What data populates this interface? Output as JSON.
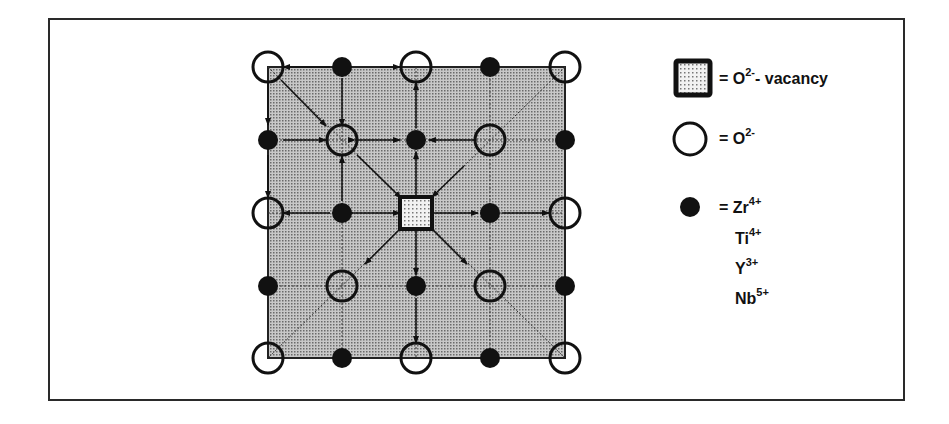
{
  "diagram": {
    "title": "",
    "lattice": {
      "columns": [
        268,
        342,
        416,
        490,
        565
      ],
      "rows": [
        67,
        140,
        213,
        286,
        358
      ],
      "fill_color": "#a9a9a9",
      "vacancy_position": [
        2,
        2
      ],
      "oxygen_sites": [
        [
          0,
          0
        ],
        [
          2,
          0
        ],
        [
          4,
          0
        ],
        [
          1,
          1
        ],
        [
          3,
          1
        ],
        [
          0,
          2
        ],
        [
          4,
          2
        ],
        [
          1,
          3
        ],
        [
          3,
          3
        ],
        [
          0,
          4
        ],
        [
          2,
          4
        ],
        [
          4,
          4
        ]
      ],
      "cation_sites": [
        [
          1,
          0
        ],
        [
          3,
          0
        ],
        [
          0,
          1
        ],
        [
          2,
          1
        ],
        [
          4,
          1
        ],
        [
          1,
          2
        ],
        [
          3,
          2
        ],
        [
          0,
          3
        ],
        [
          2,
          3
        ],
        [
          4,
          3
        ],
        [
          1,
          4
        ],
        [
          3,
          4
        ]
      ]
    },
    "legend": {
      "vacancy": {
        "symbol": "shaded-square",
        "label": "= O",
        "sup": "2-",
        "suffix": "- vacancy"
      },
      "oxygen": {
        "symbol": "open-circle",
        "label": "= O",
        "sup": "2-"
      },
      "cations": [
        {
          "symbol": "filled-circle",
          "prefix": "= ",
          "label": "Zr",
          "sup": "4+"
        },
        {
          "label": "Ti",
          "sup": "4+"
        },
        {
          "label": "Y",
          "sup": "3+"
        },
        {
          "label": "Nb",
          "sup": "5+"
        }
      ]
    }
  }
}
